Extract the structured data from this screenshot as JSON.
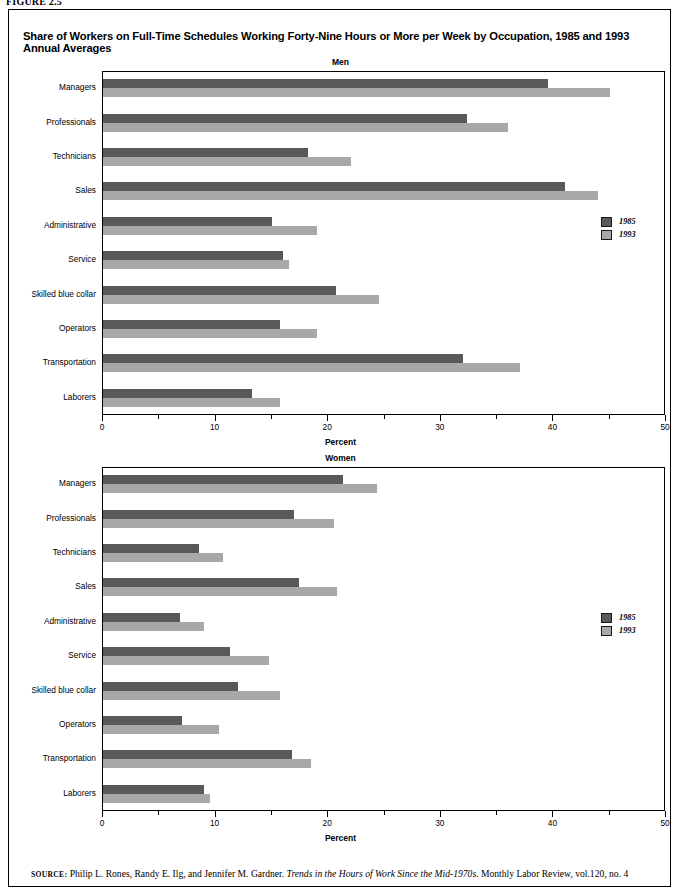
{
  "figure": {
    "label": "FIGURE 2.5",
    "title": "Share of Workers on Full-Time Schedules Working Forty-Nine Hours or More per Week by Occupation, 1985 and 1993 Annual Averages"
  },
  "source": {
    "prefix": "SOURCE:",
    "authors": "Philip L. Rones, Randy E. Ilg, and Jennifer M. Gardner.",
    "italic_title": "Trends in the Hours of Work Since the Mid-1970s.",
    "publication": "Monthly Labor Review, vol.120, no. 4"
  },
  "legend": {
    "items": [
      {
        "label": "1985",
        "color": "#595959",
        "key": "c85"
      },
      {
        "label": "1993",
        "color": "#a8a8a8",
        "key": "c93"
      }
    ]
  },
  "chart_data": [
    {
      "type": "bar",
      "orientation": "horizontal",
      "title": "Men",
      "xlabel": "Percent",
      "ylabel": "",
      "xlim": [
        0,
        50
      ],
      "xticks": [
        0,
        10,
        20,
        30,
        40,
        50
      ],
      "xtick_labels": [
        "0",
        "10",
        "20",
        "30",
        "40",
        "50"
      ],
      "minor_xticks": [
        5,
        15,
        25,
        35,
        45
      ],
      "grid": false,
      "legend_position": "right-middle",
      "categories": [
        "Managers",
        "Professionals",
        "Technicians",
        "Sales",
        "Administrative",
        "Service",
        "Skilled blue collar",
        "Operators",
        "Transportation",
        "Laborers"
      ],
      "series": [
        {
          "name": "1985",
          "color": "#595959",
          "values": [
            39.5,
            32.3,
            18.2,
            41.0,
            15.0,
            16.0,
            20.7,
            15.7,
            32.0,
            13.2
          ]
        },
        {
          "name": "1993",
          "color": "#a8a8a8",
          "values": [
            45.0,
            36.0,
            22.0,
            44.0,
            19.0,
            16.5,
            24.5,
            19.0,
            37.0,
            15.7
          ]
        }
      ]
    },
    {
      "type": "bar",
      "orientation": "horizontal",
      "title": "Women",
      "xlabel": "Percent",
      "ylabel": "",
      "xlim": [
        0,
        50
      ],
      "xticks": [
        0,
        10,
        20,
        30,
        40,
        50
      ],
      "xtick_labels": [
        "0",
        "10",
        "20",
        "30",
        "40",
        "50"
      ],
      "minor_xticks": [
        5,
        15,
        25,
        35,
        45
      ],
      "grid": false,
      "legend_position": "right-middle",
      "categories": [
        "Managers",
        "Professionals",
        "Technicians",
        "Sales",
        "Administrative",
        "Service",
        "Skilled blue collar",
        "Operators",
        "Transportation",
        "Laborers"
      ],
      "series": [
        {
          "name": "1985",
          "color": "#595959",
          "values": [
            21.3,
            17.0,
            8.5,
            17.4,
            6.8,
            11.3,
            12.0,
            7.0,
            16.8,
            9.0
          ]
        },
        {
          "name": "1993",
          "color": "#a8a8a8",
          "values": [
            24.3,
            20.5,
            10.7,
            20.8,
            9.0,
            14.7,
            15.7,
            10.3,
            18.5,
            9.5
          ]
        }
      ]
    }
  ]
}
